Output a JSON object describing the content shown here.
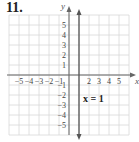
{
  "problem": {
    "number": "11."
  },
  "chart_data": {
    "type": "line",
    "title": "",
    "xlabel": "x",
    "ylabel": "y",
    "xlim": [
      -6,
      6
    ],
    "ylim": [
      -6,
      6
    ],
    "grid": true,
    "x_ticks": [
      "-5",
      "-4",
      "-3",
      "-2",
      "-1",
      "2",
      "3",
      "4",
      "5"
    ],
    "y_ticks": [
      "5",
      "4",
      "3",
      "2",
      "1",
      "-1",
      "-2",
      "-3",
      "-4",
      "-5"
    ],
    "series": [
      {
        "name": "x = 1",
        "type": "vertical-line",
        "x": 1,
        "y_range": [
          -6,
          6
        ],
        "color": "#555555"
      }
    ],
    "annotations": [
      {
        "text": "x = 1",
        "x": 1.4,
        "y": -2.3
      }
    ]
  },
  "colors": {
    "grid": "#d8d8d8",
    "axis": "#666666",
    "line": "#555555"
  }
}
